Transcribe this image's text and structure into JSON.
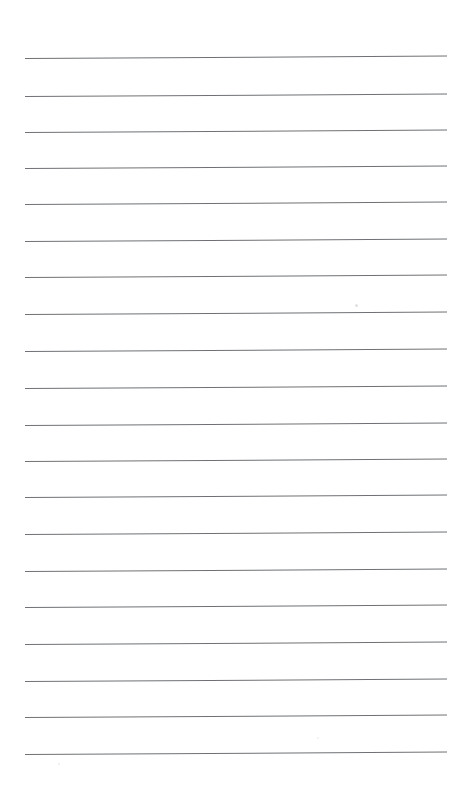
{
  "document": {
    "title": "Ruled Notepaper",
    "kind": "blank-lined-page",
    "page_number": "",
    "text_content": "",
    "width_px": 469,
    "height_px": 809
  },
  "paper": {
    "background_color": "#ffffff",
    "rule_color": "#6f7174",
    "rule_thickness_px": 1,
    "rule_count": 20,
    "rule_left_x": 25,
    "rule_right_x": 447,
    "rule_spacing_px": 36.6,
    "first_rule_y": 58,
    "slant_px": -2.5,
    "margin_top_px": 58,
    "margin_bottom_px": 54,
    "has_vertical_margin_rule": false
  },
  "rules": [
    {
      "index": 1,
      "y": 58
    },
    {
      "index": 2,
      "y": 96
    },
    {
      "index": 3,
      "y": 132
    },
    {
      "index": 4,
      "y": 168
    },
    {
      "index": 5,
      "y": 204
    },
    {
      "index": 6,
      "y": 241
    },
    {
      "index": 7,
      "y": 277
    },
    {
      "index": 8,
      "y": 314
    },
    {
      "index": 9,
      "y": 351
    },
    {
      "index": 10,
      "y": 388
    },
    {
      "index": 11,
      "y": 425
    },
    {
      "index": 12,
      "y": 461
    },
    {
      "index": 13,
      "y": 497
    },
    {
      "index": 14,
      "y": 534
    },
    {
      "index": 15,
      "y": 571
    },
    {
      "index": 16,
      "y": 607
    },
    {
      "index": 17,
      "y": 644
    },
    {
      "index": 18,
      "y": 681
    },
    {
      "index": 19,
      "y": 717
    },
    {
      "index": 20,
      "y": 754
    }
  ],
  "artifacts": [
    {
      "name": "smudge",
      "x": 355,
      "y": 304,
      "size": 3,
      "color": "#e2e2e3"
    },
    {
      "name": "speck",
      "x": 58,
      "y": 763,
      "size": 2,
      "color": "#ededee"
    },
    {
      "name": "speck",
      "x": 317,
      "y": 737,
      "size": 2,
      "color": "#f0f0f1"
    }
  ]
}
